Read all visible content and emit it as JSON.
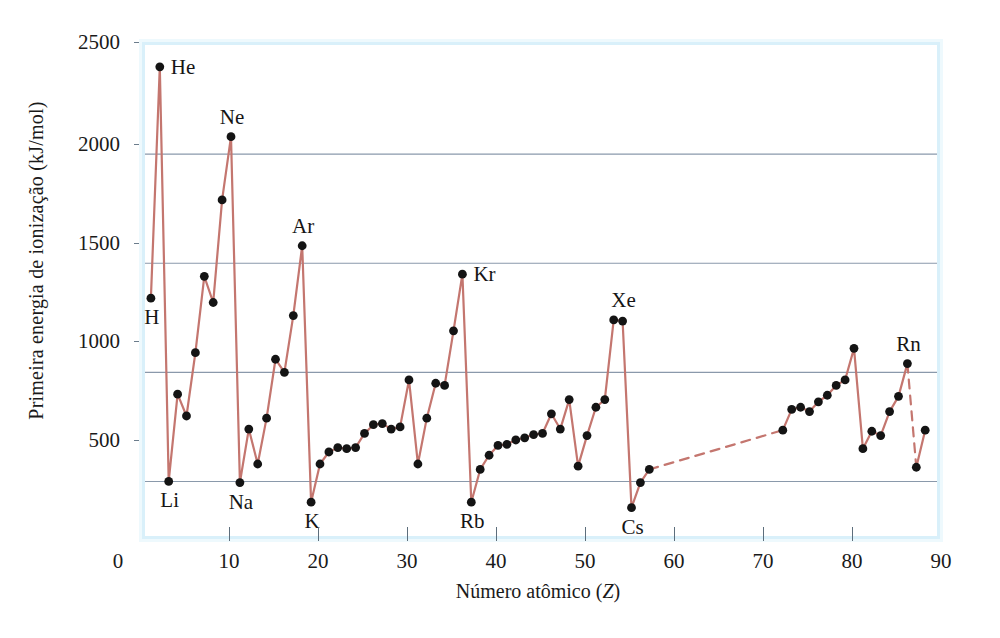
{
  "figure": {
    "title": "",
    "y_axis_label": "Primeira energia de ionização (kJ/mol)",
    "x_axis_label_prefix": "Número atômico (",
    "x_axis_label_symbol": "Z",
    "x_axis_label_suffix": ")",
    "line_color": "#c4766f",
    "dot_color": "#141414",
    "gridline_color": "#8a99ab",
    "frame_color": "#d9f0fa",
    "background_color": "#ffffff"
  },
  "chart_data": {
    "type": "line",
    "title": "",
    "xlabel": "Número atômico (Z)",
    "ylabel": "Primeira energia de ionização (kJ/mol)",
    "xlim": [
      0,
      90
    ],
    "ylim": [
      250,
      2500
    ],
    "xticks": [
      0,
      10,
      20,
      30,
      40,
      50,
      60,
      70,
      80,
      90
    ],
    "yticks": [
      500,
      1000,
      1500,
      2000,
      2500
    ],
    "grid": "horizontal",
    "legend": "none",
    "series": [
      {
        "name": "Primeira energia de ionização",
        "x": [
          1,
          2,
          3,
          4,
          5,
          6,
          7,
          8,
          9,
          10,
          11,
          12,
          13,
          14,
          15,
          16,
          17,
          18,
          19,
          20,
          21,
          22,
          23,
          24,
          25,
          26,
          27,
          28,
          29,
          30,
          31,
          32,
          33,
          34,
          35,
          36,
          37,
          38,
          39,
          40,
          41,
          42,
          43,
          44,
          45,
          46,
          47,
          48,
          49,
          50,
          51,
          52,
          53,
          54,
          55,
          56,
          57,
          72,
          73,
          74,
          75,
          76,
          77,
          78,
          79,
          80,
          81,
          82,
          83,
          84,
          85,
          86,
          87,
          88
        ],
        "values": [
          1340,
          2400,
          500,
          900,
          800,
          1090,
          1440,
          1320,
          1790,
          2080,
          495,
          740,
          580,
          790,
          1060,
          1000,
          1260,
          1580,
          405,
          580,
          635,
          655,
          650,
          655,
          720,
          760,
          765,
          740,
          750,
          965,
          580,
          790,
          950,
          940,
          1190,
          1450,
          405,
          555,
          620,
          665,
          670,
          690,
          700,
          715,
          720,
          810,
          740,
          875,
          570,
          710,
          840,
          875,
          1240,
          1235,
          380,
          495,
          555,
          735,
          830,
          840,
          820,
          865,
          895,
          940,
          965,
          1110,
          650,
          730,
          710,
          820,
          890,
          1040,
          565,
          735
        ]
      }
    ],
    "dashed_segments": [
      {
        "from_z": 57,
        "to_z": 72,
        "note": "lanthanide gap"
      },
      {
        "from_z": 86,
        "to_z": 87,
        "note": "Rn to Fr"
      }
    ],
    "point_labels": [
      {
        "symbol": "H",
        "z": 1,
        "value": 1340,
        "anchor": "below"
      },
      {
        "symbol": "He",
        "z": 2,
        "value": 2400,
        "anchor": "right"
      },
      {
        "symbol": "Li",
        "z": 3,
        "value": 500,
        "anchor": "below"
      },
      {
        "symbol": "Ne",
        "z": 10,
        "value": 2080,
        "anchor": "above"
      },
      {
        "symbol": "Na",
        "z": 11,
        "value": 495,
        "anchor": "below"
      },
      {
        "symbol": "Ar",
        "z": 18,
        "value": 1580,
        "anchor": "above"
      },
      {
        "symbol": "K",
        "z": 19,
        "value": 405,
        "anchor": "below"
      },
      {
        "symbol": "Kr",
        "z": 36,
        "value": 1450,
        "anchor": "right"
      },
      {
        "symbol": "Rb",
        "z": 37,
        "value": 405,
        "anchor": "below"
      },
      {
        "symbol": "Xe",
        "z": 54,
        "value": 1240,
        "anchor": "above"
      },
      {
        "symbol": "Cs",
        "z": 55,
        "value": 380,
        "anchor": "below"
      },
      {
        "symbol": "Rn",
        "z": 86,
        "value": 1040,
        "anchor": "above"
      }
    ]
  },
  "axes": {
    "y_tick_labels": [
      "2500",
      "2000",
      "1500",
      "1000",
      "500"
    ],
    "x_tick_labels": [
      "0",
      "10",
      "20",
      "30",
      "40",
      "50",
      "60",
      "70",
      "80",
      "90"
    ]
  }
}
